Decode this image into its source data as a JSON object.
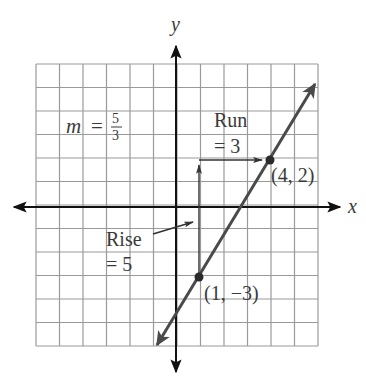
{
  "chart_data": {
    "type": "line",
    "title": "",
    "xlabel": "x",
    "ylabel": "y",
    "xlim": [
      -6,
      6
    ],
    "ylim": [
      -6,
      6
    ],
    "grid": true,
    "grid_step": 1,
    "series": [
      {
        "name": "line",
        "slope": "5/3",
        "points": [
          {
            "x": 1,
            "y": -3,
            "label": "(1, −3)"
          },
          {
            "x": 4,
            "y": 2,
            "label": "(4, 2)"
          }
        ]
      }
    ],
    "annotations": [
      {
        "text": "m = 5/3",
        "type": "slope-label"
      },
      {
        "text": "Rise = 5",
        "type": "rise",
        "from": [
          1,
          -3
        ],
        "to": [
          1,
          2
        ]
      },
      {
        "text": "Run = 3",
        "type": "run",
        "from": [
          1,
          2
        ],
        "to": [
          4,
          2
        ]
      }
    ]
  },
  "labels": {
    "x_axis": "x",
    "y_axis": "y",
    "slope_m": "m",
    "slope_eq": "=",
    "slope_num": "5",
    "slope_den": "3",
    "run_word": "Run",
    "run_value": "= 3",
    "rise_word": "Rise",
    "rise_value": "= 5",
    "point_a": "(4, 2)",
    "point_b": "(1, −3)"
  },
  "colors": {
    "grid": "#9a9a9a",
    "axis": "#111111",
    "line": "#4a4a4a",
    "text": "#3a3a3a"
  }
}
